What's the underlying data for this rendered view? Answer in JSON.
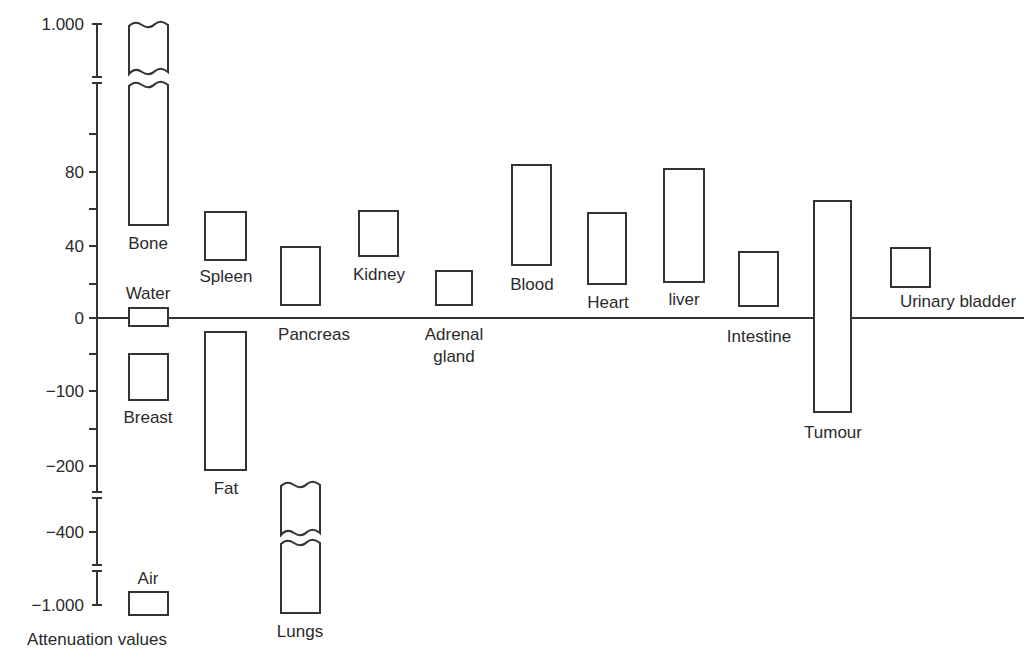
{
  "chart_data": {
    "type": "bar",
    "subtype": "floating-range",
    "title": "",
    "ylabel": "Attenuation values",
    "xlabel": "",
    "grid": false,
    "legend": null,
    "y_axis": {
      "ticks": [
        {
          "label": "1.000",
          "value": 1000,
          "y": 24
        },
        {
          "label": "80",
          "value": 80,
          "y": 172
        },
        {
          "label": "40",
          "value": 40,
          "y": 246
        },
        {
          "label": "0",
          "value": 0,
          "y": 318
        },
        {
          "label": "−100",
          "value": -100,
          "y": 391
        },
        {
          "label": "−200",
          "value": -200,
          "y": 466
        },
        {
          "label": "−400",
          "value": -400,
          "y": 532
        },
        {
          "label": "−1.000",
          "value": -1000,
          "y": 605
        }
      ],
      "minor_ticks_y": [
        134,
        209,
        284,
        354,
        429
      ],
      "breaks_y": [
        80,
        495,
        568
      ],
      "x": 97,
      "top": 24,
      "bottom": 605
    },
    "baseline": {
      "value": 0,
      "y": 318,
      "x_start": 97,
      "x_end": 1024
    },
    "categories": [
      "Bone",
      "Water",
      "Breast",
      "Air",
      "Spleen",
      "Fat",
      "Pancreas",
      "Lungs",
      "Kidney",
      "Adrenal gland",
      "Blood",
      "Heart",
      "liver",
      "Intestine",
      "Tumour",
      "Urinary bladder"
    ],
    "ranges": [
      {
        "name": "Bone",
        "low": 50,
        "high": 1000,
        "broken": true
      },
      {
        "name": "Water",
        "low": -5,
        "high": 5
      },
      {
        "name": "Breast",
        "low": -110,
        "high": -50
      },
      {
        "name": "Air",
        "low": -1000,
        "high": -1000
      },
      {
        "name": "Spleen",
        "low": 30,
        "high": 60
      },
      {
        "name": "Fat",
        "low": -200,
        "high": -20
      },
      {
        "name": "Pancreas",
        "low": 10,
        "high": 40
      },
      {
        "name": "Lungs",
        "low": -1000,
        "high": -300,
        "broken": true
      },
      {
        "name": "Kidney",
        "low": 35,
        "high": 60
      },
      {
        "name": "Adrenal gland",
        "low": 10,
        "high": 25
      },
      {
        "name": "Blood",
        "low": 30,
        "high": 85
      },
      {
        "name": "Heart",
        "low": 20,
        "high": 58
      },
      {
        "name": "liver",
        "low": 20,
        "high": 82
      },
      {
        "name": "Intestine",
        "low": 10,
        "high": 36
      },
      {
        "name": "Tumour",
        "low": -130,
        "high": 65
      },
      {
        "name": "Urinary bladder",
        "low": 15,
        "high": 38
      }
    ]
  },
  "boxes": [
    {
      "name": "water",
      "x": 129,
      "y": 308,
      "w": 39,
      "h": 18
    },
    {
      "name": "breast",
      "x": 129,
      "y": 354,
      "w": 39,
      "h": 46
    },
    {
      "name": "air",
      "x": 129,
      "y": 592,
      "w": 39,
      "h": 23
    },
    {
      "name": "spleen",
      "x": 205,
      "y": 212,
      "w": 41,
      "h": 48
    },
    {
      "name": "fat",
      "x": 205,
      "y": 332,
      "w": 41,
      "h": 138
    },
    {
      "name": "pancreas",
      "x": 281,
      "y": 247,
      "w": 39,
      "h": 58
    },
    {
      "name": "kidney",
      "x": 359,
      "y": 211,
      "w": 39,
      "h": 45
    },
    {
      "name": "adrenal-gland",
      "x": 436,
      "y": 271,
      "w": 36,
      "h": 34
    },
    {
      "name": "blood",
      "x": 512,
      "y": 165,
      "w": 39,
      "h": 100
    },
    {
      "name": "heart",
      "x": 588,
      "y": 213,
      "w": 38,
      "h": 71
    },
    {
      "name": "liver",
      "x": 664,
      "y": 169,
      "w": 40,
      "h": 113
    },
    {
      "name": "intestine",
      "x": 739,
      "y": 252,
      "w": 39,
      "h": 54
    },
    {
      "name": "tumour",
      "x": 814,
      "y": 201,
      "w": 37,
      "h": 211
    },
    {
      "name": "urinary-bladder",
      "x": 891,
      "y": 248,
      "w": 39,
      "h": 39
    }
  ],
  "labels": [
    {
      "key": "bone",
      "text": "Bone",
      "x": 148,
      "y": 249
    },
    {
      "key": "water",
      "text": "Water",
      "x": 148,
      "y": 299
    },
    {
      "key": "breast",
      "text": "Breast",
      "x": 148,
      "y": 423
    },
    {
      "key": "air",
      "text": "Air",
      "x": 148,
      "y": 584
    },
    {
      "key": "spleen",
      "text": "Spleen",
      "x": 226,
      "y": 282
    },
    {
      "key": "fat",
      "text": "Fat",
      "x": 226,
      "y": 494
    },
    {
      "key": "pancreas",
      "text": "Pancreas",
      "x": 314,
      "y": 340
    },
    {
      "key": "lungs",
      "text": "Lungs",
      "x": 300,
      "y": 637
    },
    {
      "key": "kidney",
      "text": "Kidney",
      "x": 379,
      "y": 280
    },
    {
      "key": "adrenal-gland-line1",
      "text": "Adrenal",
      "x": 454,
      "y": 340
    },
    {
      "key": "adrenal-gland-line2",
      "text": "gland",
      "x": 454,
      "y": 362
    },
    {
      "key": "blood",
      "text": "Blood",
      "x": 532,
      "y": 290
    },
    {
      "key": "heart",
      "text": "Heart",
      "x": 608,
      "y": 308
    },
    {
      "key": "liver",
      "text": "liver",
      "x": 684,
      "y": 305
    },
    {
      "key": "intestine",
      "text": "Intestine",
      "x": 759,
      "y": 342
    },
    {
      "key": "tumour",
      "text": "Tumour",
      "x": 833,
      "y": 438
    },
    {
      "key": "urinary-bladder",
      "text": "Urinary bladder",
      "x": 958,
      "y": 307
    }
  ],
  "axis_title": {
    "text": "Attenuation values",
    "x": 97,
    "y": 645
  }
}
